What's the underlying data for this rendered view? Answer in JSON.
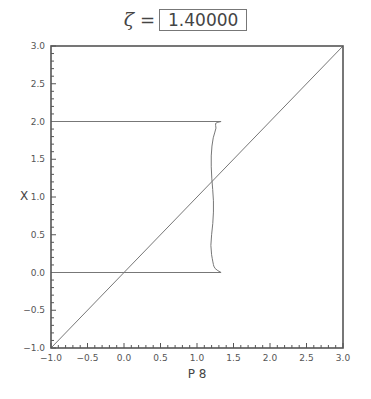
{
  "title": {
    "symbol": "ζ",
    "equals": "=",
    "value": "1.40000"
  },
  "chart_data": {
    "type": "line",
    "xlabel": "P 8",
    "ylabel": "X",
    "xlim": [
      -1.0,
      3.0
    ],
    "ylim": [
      -1.0,
      3.0
    ],
    "grid": false,
    "x_ticks": [
      "-1.0",
      "-0.5",
      "0.0",
      "0.5",
      "1.0",
      "1.5",
      "2.0",
      "2.5",
      "3.0"
    ],
    "y_ticks": [
      "-1.0",
      "-0.5",
      "0.0",
      "0.5",
      "1.0",
      "1.5",
      "2.0",
      "2.5",
      "3.0"
    ],
    "minor_tick_step": 0.1,
    "series": [
      {
        "name": "diagonal",
        "x": [
          -1.0,
          3.0
        ],
        "y": [
          -1.0,
          3.0
        ]
      },
      {
        "name": "upper-horizontal",
        "x": [
          -1.0,
          1.33
        ],
        "y": [
          2.0,
          2.0
        ]
      },
      {
        "name": "lower-horizontal",
        "x": [
          -1.0,
          1.33
        ],
        "y": [
          0.0,
          0.0
        ]
      },
      {
        "name": "curve",
        "x": [
          1.33,
          1.24,
          1.27,
          1.22,
          1.19,
          1.2,
          1.23,
          1.22,
          1.18,
          1.22,
          1.24,
          1.33
        ],
        "y": [
          2.0,
          1.98,
          1.92,
          1.8,
          1.55,
          1.25,
          0.95,
          0.65,
          0.35,
          0.12,
          0.05,
          0.0
        ]
      }
    ]
  }
}
